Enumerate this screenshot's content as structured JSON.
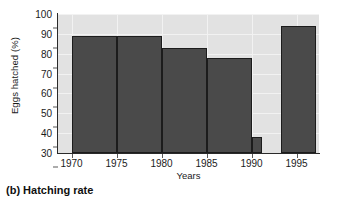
{
  "figure": {
    "caption": "(b) Hatching rate",
    "background_color": "#ffffff",
    "plot_background_color": "#e2e2e2",
    "bar_color": "#4a4a4a",
    "bar_edge_color": "#1c1c1c",
    "gridline_color": "#f2f2f2",
    "axis_color": "#2a2a2a"
  },
  "chart_data": {
    "type": "bar",
    "title": "(b) Hatching rate",
    "xlabel": "Years",
    "ylabel": "Eggs hatched (%)",
    "xlim": [
      1968.5,
      1997.5
    ],
    "ylim": [
      30,
      100
    ],
    "grid": true,
    "legend": null,
    "ytick_labels": [
      "30",
      "40",
      "50",
      "60",
      "70",
      "80",
      "90",
      "100"
    ],
    "yticks": [
      30,
      40,
      50,
      60,
      70,
      80,
      90,
      100
    ],
    "xtick_labels": [
      "1970",
      "1975",
      "1980",
      "1985",
      "1990",
      "1995"
    ],
    "xticks": [
      1970,
      1975,
      1980,
      1985,
      1990,
      1995
    ],
    "categories": [
      "1970-1975",
      "1975-1980",
      "1980-1985",
      "1985-1990",
      "1990",
      "1993-1997"
    ],
    "values": [
      89,
      89,
      83,
      78,
      38,
      94
    ],
    "bars": [
      {
        "label": "1970-1975",
        "x_start": 1970,
        "x_end": 1975,
        "value": 89
      },
      {
        "label": "1975-1980",
        "x_start": 1975,
        "x_end": 1980,
        "value": 89
      },
      {
        "label": "1980-1985",
        "x_start": 1980,
        "x_end": 1985,
        "value": 83
      },
      {
        "label": "1985-1990",
        "x_start": 1985,
        "x_end": 1990,
        "value": 78
      },
      {
        "label": "1990",
        "x_start": 1990,
        "x_end": 1991.2,
        "value": 38
      },
      {
        "label": "1993-1997",
        "x_start": 1993.3,
        "x_end": 1997.2,
        "value": 94
      }
    ]
  }
}
